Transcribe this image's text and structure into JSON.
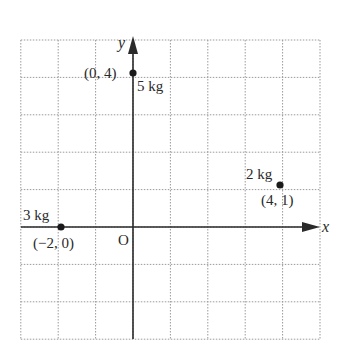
{
  "diagram": {
    "type": "coordinate-grid-with-point-masses",
    "grid": {
      "x_min": -3,
      "x_max": 5,
      "y_min": -3,
      "y_max": 5,
      "step": 1,
      "style": "dotted"
    },
    "axes": {
      "x_label": "x",
      "y_label": "y",
      "origin_label": "O"
    },
    "points": [
      {
        "coord_label": "(0, 4)",
        "mass_label": "5 kg",
        "x": 0,
        "y": 4
      },
      {
        "coord_label": "(4, 1)",
        "mass_label": "2 kg",
        "x": 4,
        "y": 1
      },
      {
        "coord_label": "(−2, 0)",
        "mass_label": "3 kg",
        "x": -2,
        "y": 0
      }
    ],
    "colors": {
      "ink": "#2a2a2a",
      "grid": "#9a9a9a"
    }
  }
}
